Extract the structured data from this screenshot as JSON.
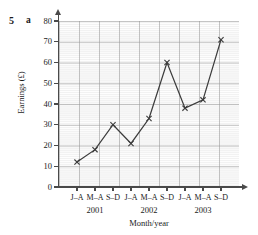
{
  "exercise": {
    "number": "5",
    "part": "a"
  },
  "chart_data": {
    "type": "line",
    "title": "",
    "xlabel": "Month/year",
    "ylabel": "Earnings (£)",
    "ylim": [
      0,
      80
    ],
    "yticks": [
      0,
      10,
      20,
      30,
      40,
      50,
      60,
      70,
      80
    ],
    "ytick_labels": [
      "0",
      "10",
      "20",
      "30",
      "40",
      "50",
      "60",
      "70",
      "80"
    ],
    "categories": [
      "J–A",
      "M–A",
      "S–D",
      "J–A",
      "M–A",
      "S–D",
      "J–A",
      "M–A",
      "S–D"
    ],
    "group_labels": [
      "2001",
      "2002",
      "2003"
    ],
    "values": [
      12,
      18,
      30,
      21,
      33,
      60,
      38,
      42,
      71
    ],
    "grid": true,
    "legend": "none",
    "marker": "cross",
    "line_color": "#3c3c3c",
    "grid_color": "#969696",
    "plot_background": "#f2f2f2"
  }
}
